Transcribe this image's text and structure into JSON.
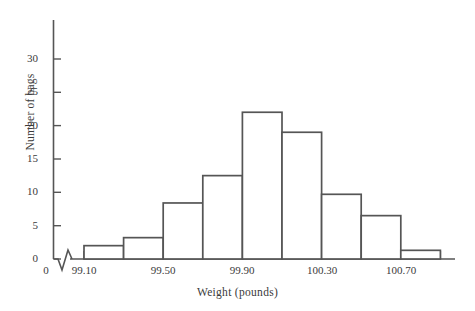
{
  "chart_data": {
    "type": "bar",
    "title": "",
    "subtitle": "",
    "xlabel": "Weight (pounds)",
    "ylabel": "Number of bags",
    "grid": false,
    "legend": null,
    "axis_break_x": true,
    "note": "Histogram of bag weights; bin width 0.10 pounds",
    "bin_width": 0.1,
    "bin_edges": [
      99.0,
      99.1,
      99.2,
      99.3,
      99.4,
      99.5,
      99.6,
      99.7,
      99.8,
      99.9,
      100.0,
      100.1,
      100.2,
      100.3,
      100.4,
      100.5,
      100.6,
      100.7,
      100.8,
      100.9
    ],
    "bars": [
      {
        "left": 99.1,
        "right": 99.2,
        "value": 2
      },
      {
        "left": 99.2,
        "right": 99.3,
        "value": 3.2
      },
      {
        "left": 99.3,
        "right": 99.4,
        "value": 8.4
      },
      {
        "left": 99.4,
        "right": 99.5,
        "value": 12.5
      },
      {
        "left": 99.5,
        "right": 99.6,
        "value": 22
      },
      {
        "left": 99.6,
        "right": 99.7,
        "value": 19
      },
      {
        "left": 99.7,
        "right": 99.8,
        "value": 9.7
      },
      {
        "left": 99.8,
        "right": 99.9,
        "value": 6.5
      },
      {
        "left": 99.9,
        "right": 100.0,
        "value": 1.3
      }
    ],
    "categories": [
      "99.10-99.20",
      "99.20-99.30",
      "99.30-99.40",
      "99.40-99.50",
      "99.50-99.60",
      "99.60-99.70",
      "99.70-99.80",
      "99.80-99.90",
      "99.90-100.00"
    ],
    "values": [
      2,
      3.2,
      8.4,
      12.5,
      22,
      19,
      9.7,
      6.5,
      1.3
    ],
    "ylim": [
      0,
      33
    ],
    "yticks": [
      0,
      5,
      10,
      15,
      20,
      25,
      30
    ],
    "ytick_labels": [
      "0",
      "5",
      "10",
      "15",
      "20",
      "25",
      "30"
    ],
    "xtick_labels": [
      "0",
      "99.10",
      "99.50",
      "99.90",
      "100.30",
      "100.70"
    ],
    "xticks": [
      0,
      99.1,
      99.5,
      99.9,
      100.3,
      100.7
    ],
    "bar_fill": "#ffffff",
    "bar_stroke": "#555555",
    "axis_color": "#555555"
  }
}
